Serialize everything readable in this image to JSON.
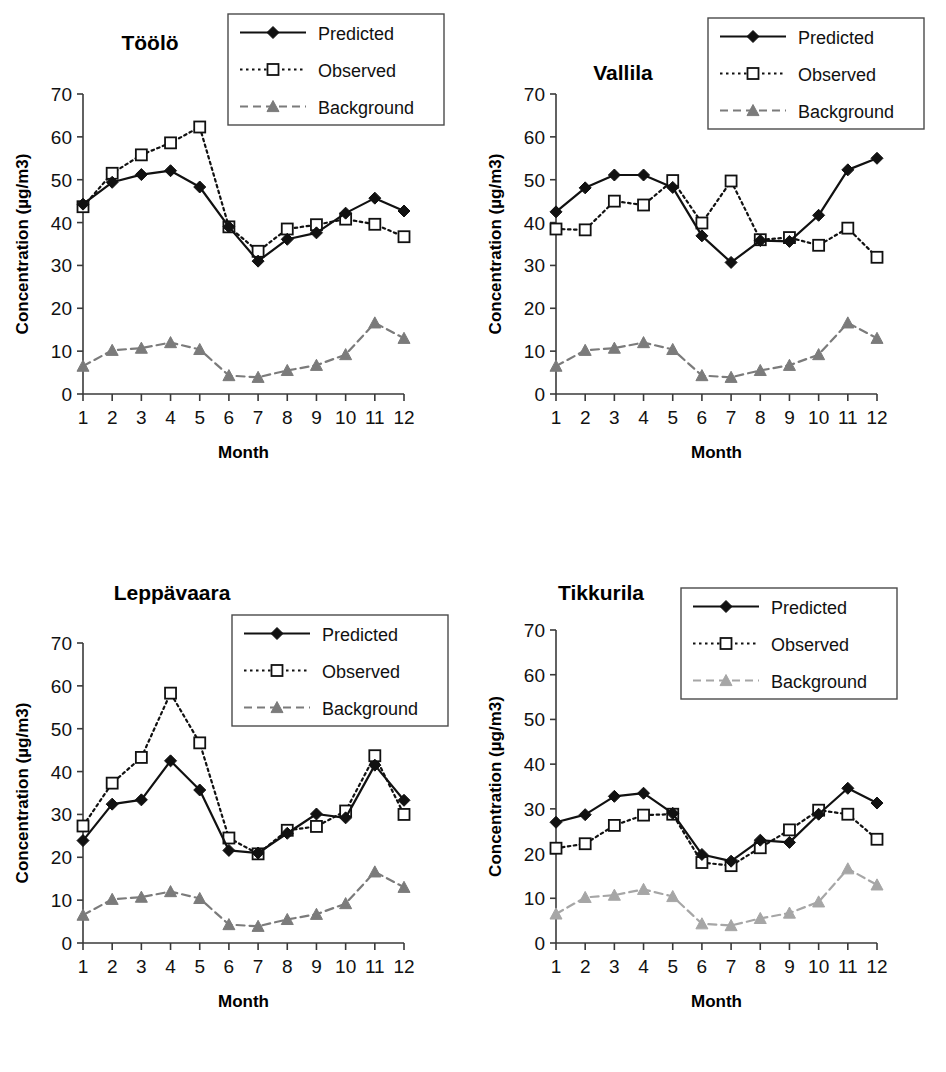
{
  "figure": {
    "panel_count": 4,
    "series_names": [
      "Predicted",
      "Observed",
      "Background"
    ],
    "colors": {
      "predicted": "#111111",
      "observed": "#111111",
      "background": "#7b7b7b",
      "background_light": "#a6a6a6",
      "axis": "#3a3a3a",
      "text": "#111111"
    }
  },
  "legend": {
    "predicted_label": "Predicted",
    "observed_label": "Observed",
    "background_label": "Background"
  },
  "axes": {
    "ylabel": "Concentration  (µg/m3)",
    "xlabel": "Month",
    "yticks": [
      "0",
      "10",
      "20",
      "30",
      "40",
      "50",
      "60",
      "70"
    ],
    "xticks": [
      "1",
      "2",
      "3",
      "4",
      "5",
      "6",
      "7",
      "8",
      "9",
      "10",
      "11",
      "12"
    ],
    "ylim": [
      0,
      70
    ],
    "xlim": [
      1,
      12
    ]
  },
  "chart_data": [
    {
      "type": "line",
      "title": "Töölö",
      "xlabel": "Month",
      "ylabel": "Concentration  (µg/m3)",
      "categories": [
        1,
        2,
        3,
        4,
        5,
        6,
        7,
        8,
        9,
        10,
        11,
        12
      ],
      "ylim": [
        0,
        70
      ],
      "grid": false,
      "legend_position": "top-right",
      "series": [
        {
          "name": "Predicted",
          "values": [
            44.3,
            49.4,
            51.2,
            52.1,
            48.3,
            39.0,
            31.0,
            36.1,
            37.6,
            42.2,
            45.7,
            42.7
          ]
        },
        {
          "name": "Observed",
          "values": [
            43.7,
            51.5,
            55.8,
            58.6,
            62.3,
            39.0,
            33.3,
            38.5,
            39.5,
            40.8,
            39.6,
            36.7
          ]
        },
        {
          "name": "Background",
          "values": [
            6.5,
            10.2,
            10.7,
            12.0,
            10.4,
            4.3,
            3.9,
            5.5,
            6.7,
            9.2,
            16.6,
            13.0
          ]
        }
      ]
    },
    {
      "type": "line",
      "title": "Vallila",
      "xlabel": "Month",
      "ylabel": "Concentration  (µg/m3)",
      "categories": [
        1,
        2,
        3,
        4,
        5,
        6,
        7,
        8,
        9,
        10,
        11,
        12
      ],
      "ylim": [
        0,
        70
      ],
      "grid": false,
      "legend_position": "top-right",
      "series": [
        {
          "name": "Predicted",
          "values": [
            42.5,
            48.1,
            51.1,
            51.1,
            48.2,
            36.9,
            30.7,
            35.8,
            35.6,
            41.7,
            52.3,
            55.0
          ]
        },
        {
          "name": "Observed",
          "values": [
            38.5,
            38.3,
            45.0,
            44.1,
            49.8,
            39.9,
            49.7,
            36.0,
            36.5,
            34.7,
            38.7,
            31.9
          ]
        },
        {
          "name": "Background",
          "values": [
            6.5,
            10.2,
            10.7,
            12.0,
            10.4,
            4.3,
            3.9,
            5.5,
            6.7,
            9.2,
            16.6,
            13.0
          ]
        }
      ]
    },
    {
      "type": "line",
      "title": "Leppävaara",
      "xlabel": "Month",
      "ylabel": "Concentration  (µg/m3)",
      "categories": [
        1,
        2,
        3,
        4,
        5,
        6,
        7,
        8,
        9,
        10,
        11,
        12
      ],
      "ylim": [
        0,
        70
      ],
      "grid": false,
      "legend_position": "top-right",
      "series": [
        {
          "name": "Predicted",
          "values": [
            23.9,
            32.4,
            33.4,
            42.5,
            35.7,
            21.6,
            21.0,
            25.6,
            30.1,
            29.2,
            41.5,
            33.3
          ]
        },
        {
          "name": "Observed",
          "values": [
            27.3,
            37.3,
            43.3,
            58.3,
            46.7,
            24.5,
            20.8,
            26.3,
            27.2,
            30.8,
            43.7,
            30.0
          ]
        },
        {
          "name": "Background",
          "values": [
            6.5,
            10.2,
            10.7,
            12.0,
            10.4,
            4.3,
            3.9,
            5.5,
            6.7,
            9.2,
            16.6,
            13.0
          ]
        }
      ]
    },
    {
      "type": "line",
      "title": "Tikkurila",
      "xlabel": "Month",
      "ylabel": "Concentration  (µg/m3)",
      "categories": [
        1,
        2,
        3,
        4,
        5,
        6,
        7,
        8,
        9,
        10,
        11,
        12
      ],
      "ylim": [
        0,
        70
      ],
      "grid": false,
      "legend_position": "top-right",
      "series": [
        {
          "name": "Predicted",
          "values": [
            27.0,
            28.7,
            32.8,
            33.5,
            29.0,
            19.8,
            18.3,
            23.0,
            22.5,
            28.8,
            34.6,
            31.3
          ]
        },
        {
          "name": "Observed",
          "values": [
            21.2,
            22.2,
            26.3,
            28.6,
            28.8,
            18.0,
            17.3,
            21.3,
            25.3,
            29.7,
            28.8,
            23.2
          ]
        },
        {
          "name": "Background",
          "values": [
            6.5,
            10.2,
            10.7,
            12.0,
            10.4,
            4.3,
            3.9,
            5.5,
            6.7,
            9.2,
            16.6,
            13.0
          ]
        }
      ]
    }
  ]
}
